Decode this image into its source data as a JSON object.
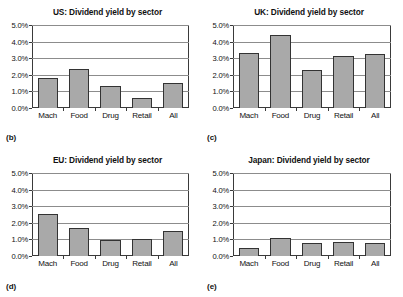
{
  "figure": {
    "panels": [
      {
        "letter": "(b)",
        "title": "US: Dividend yield by sector",
        "categories": [
          "Mach",
          "Food",
          "Drug",
          "Retail",
          "All"
        ],
        "values": [
          1.8,
          2.35,
          1.3,
          0.6,
          1.5
        ]
      },
      {
        "letter": "(c)",
        "title": "UK: Dividend yield by sector",
        "categories": [
          "Mach",
          "Food",
          "Drug",
          "Retail",
          "All"
        ],
        "values": [
          3.3,
          4.4,
          2.3,
          3.15,
          3.25
        ]
      },
      {
        "letter": "(d)",
        "title": "EU: Dividend yield by sector",
        "categories": [
          "Mach",
          "Food",
          "Drug",
          "Retail",
          "All"
        ],
        "values": [
          2.55,
          1.7,
          0.95,
          1.05,
          1.5
        ]
      },
      {
        "letter": "(e)",
        "title": "Japan: Dividend yield by sector",
        "categories": [
          "Mach",
          "Food",
          "Drug",
          "Retail",
          "All"
        ],
        "values": [
          0.5,
          1.1,
          0.78,
          0.85,
          0.78
        ]
      }
    ],
    "ytick_labels": [
      "5.0%",
      "4.0%",
      "3.0%",
      "2.0%",
      "1.0%",
      "0.0%"
    ],
    "ytick_values": [
      5,
      4,
      3,
      2,
      1,
      0
    ],
    "ylim": [
      0,
      5
    ],
    "bar_color": "#a9a9a9",
    "bar_border_color": "#333333",
    "gridline_color": "#8c8c8c",
    "axis_color": "#3a3a3a"
  },
  "chart_data": [
    {
      "type": "bar",
      "title": "US: Dividend yield by sector",
      "panel_label": "(b)",
      "categories": [
        "Mach",
        "Food",
        "Drug",
        "Retail",
        "All"
      ],
      "values": [
        1.8,
        2.35,
        1.3,
        0.6,
        1.5
      ],
      "xlabel": "",
      "ylabel": "",
      "ylim": [
        0,
        5
      ],
      "yticks": [
        0,
        1,
        2,
        3,
        4,
        5
      ],
      "ytick_labels": [
        "0.0%",
        "1.0%",
        "2.0%",
        "3.0%",
        "4.0%",
        "5.0%"
      ],
      "units": "percent",
      "grid": "horizontal",
      "legend": "none"
    },
    {
      "type": "bar",
      "title": "UK: Dividend yield by sector",
      "panel_label": "(c)",
      "categories": [
        "Mach",
        "Food",
        "Drug",
        "Retail",
        "All"
      ],
      "values": [
        3.3,
        4.4,
        2.3,
        3.15,
        3.25
      ],
      "xlabel": "",
      "ylabel": "",
      "ylim": [
        0,
        5
      ],
      "yticks": [
        0,
        1,
        2,
        3,
        4,
        5
      ],
      "ytick_labels": [
        "0.0%",
        "1.0%",
        "2.0%",
        "3.0%",
        "4.0%",
        "5.0%"
      ],
      "units": "percent",
      "grid": "horizontal",
      "legend": "none"
    },
    {
      "type": "bar",
      "title": "EU: Dividend yield by sector",
      "panel_label": "(d)",
      "categories": [
        "Mach",
        "Food",
        "Drug",
        "Retail",
        "All"
      ],
      "values": [
        2.55,
        1.7,
        0.95,
        1.05,
        1.5
      ],
      "xlabel": "",
      "ylabel": "",
      "ylim": [
        0,
        5
      ],
      "yticks": [
        0,
        1,
        2,
        3,
        4,
        5
      ],
      "ytick_labels": [
        "0.0%",
        "1.0%",
        "2.0%",
        "3.0%",
        "4.0%",
        "5.0%"
      ],
      "units": "percent",
      "grid": "horizontal",
      "legend": "none"
    },
    {
      "type": "bar",
      "title": "Japan: Dividend yield by sector",
      "panel_label": "(e)",
      "categories": [
        "Mach",
        "Food",
        "Drug",
        "Retail",
        "All"
      ],
      "values": [
        0.5,
        1.1,
        0.78,
        0.85,
        0.78
      ],
      "xlabel": "",
      "ylabel": "",
      "ylim": [
        0,
        5
      ],
      "yticks": [
        0,
        1,
        2,
        3,
        4,
        5
      ],
      "ytick_labels": [
        "0.0%",
        "1.0%",
        "2.0%",
        "3.0%",
        "4.0%",
        "5.0%"
      ],
      "units": "percent",
      "grid": "horizontal",
      "legend": "none"
    }
  ]
}
